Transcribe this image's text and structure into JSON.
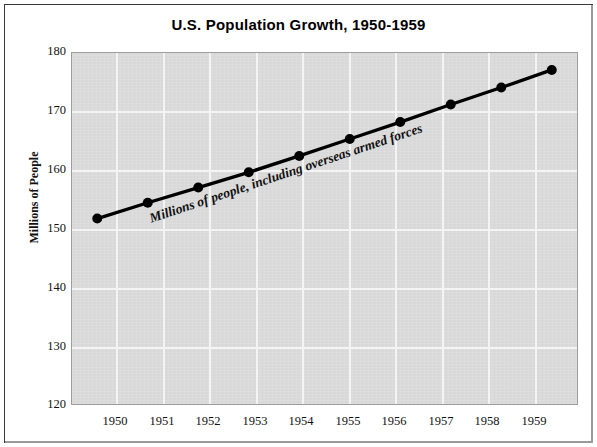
{
  "chart_data": {
    "type": "line",
    "title": "U.S. Population Growth, 1950-1959",
    "xlabel": "",
    "ylabel": "Millions of People",
    "categories": [
      "1950",
      "1951",
      "1952",
      "1953",
      "1954",
      "1955",
      "1956",
      "1957",
      "1958",
      "1959"
    ],
    "values": [
      151.7,
      154.4,
      157.0,
      159.6,
      162.4,
      165.3,
      168.2,
      171.2,
      174.1,
      177.1
    ],
    "series": [
      {
        "name": "U.S. Population",
        "values": [
          151.7,
          154.4,
          157.0,
          159.6,
          162.4,
          165.3,
          168.2,
          171.2,
          174.1,
          177.1
        ]
      }
    ],
    "ylim": [
      120,
      180
    ],
    "yticks": [
      "120",
      "130",
      "140",
      "150",
      "160",
      "170",
      "180"
    ],
    "ytick_values": [
      120,
      130,
      140,
      150,
      160,
      170,
      180
    ],
    "grid": true,
    "legend": "none",
    "annotations": [
      {
        "text": "Millions of people, including overseas armed forces",
        "placement": "along-line"
      }
    ],
    "colors": {
      "line": "#000000",
      "marker": "#000000",
      "plot_background": "#dcdcdc",
      "gridline": "#f4f4f4",
      "text": "#111111",
      "frame": "#3a3a3a"
    }
  }
}
